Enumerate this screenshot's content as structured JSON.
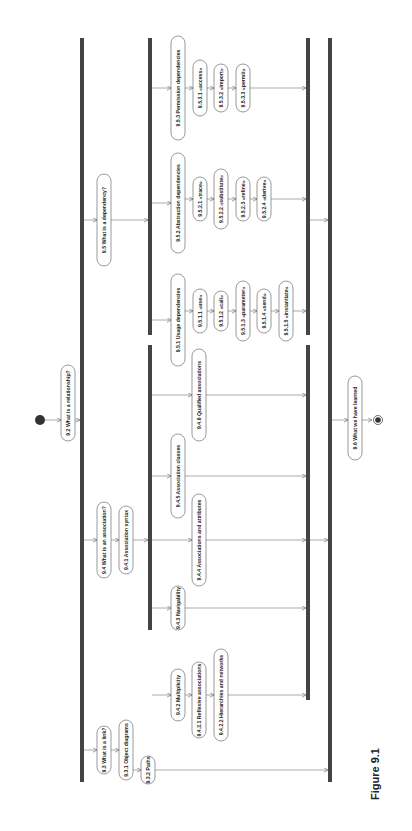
{
  "caption": "Figure 9.1",
  "diagram": {
    "start_node": "initial-state",
    "end_node": "final-state",
    "nodes": [
      {
        "id": "n92",
        "label": "9.2 What is a relationship?"
      },
      {
        "id": "n93",
        "label": "9.3 What is a link?"
      },
      {
        "id": "n931",
        "label": "9.3.1 Object diagrams"
      },
      {
        "id": "n932",
        "label": "9.3.2 Paths"
      },
      {
        "id": "n94",
        "label": "9.4 What is an association?"
      },
      {
        "id": "n941",
        "label": "9.4.1 Association syntax"
      },
      {
        "id": "n942",
        "label": "9.4.2 Multiplicity"
      },
      {
        "id": "n9421",
        "label": "9.4.2.1 Reflexive associations"
      },
      {
        "id": "n9422",
        "label": "9.4.2.2 Hierarchies and networks"
      },
      {
        "id": "n943",
        "label": "9.4.3 Navigability"
      },
      {
        "id": "n944",
        "label": "9.4.4 Associations and attributes"
      },
      {
        "id": "n945",
        "label": "9.4.5 Association classes"
      },
      {
        "id": "n946",
        "label": "9.4.6 Qualified associations"
      },
      {
        "id": "n95",
        "label": "9.5 What is a dependency?"
      },
      {
        "id": "n951",
        "label": "9.5.1 Usage dependencies"
      },
      {
        "id": "n9511",
        "label": "9.5.1.1 «use»"
      },
      {
        "id": "n9512",
        "label": "9.5.1.2 «call»"
      },
      {
        "id": "n9513",
        "label": "9.5.1.3 «parameter»"
      },
      {
        "id": "n9514",
        "label": "9.5.1.4 «send»"
      },
      {
        "id": "n9515",
        "label": "9.5.1.5 «instantiate»"
      },
      {
        "id": "n952",
        "label": "9.5.2 Abstraction dependencies"
      },
      {
        "id": "n9521",
        "label": "9.5.2.1 «trace»"
      },
      {
        "id": "n9522",
        "label": "9.5.2.2 «substitute»"
      },
      {
        "id": "n9523",
        "label": "9.5.2.3 «refine»"
      },
      {
        "id": "n9524",
        "label": "9.5.2.4 «derive»"
      },
      {
        "id": "n953",
        "label": "9.5.3 Permission dependencies"
      },
      {
        "id": "n9531",
        "label": "9.5.3.1 «access»"
      },
      {
        "id": "n9532",
        "label": "9.5.3.2 «import»"
      },
      {
        "id": "n9533",
        "label": "9.5.3.3 «permit»"
      },
      {
        "id": "n96",
        "label": "9.6 What we have learned"
      }
    ]
  }
}
